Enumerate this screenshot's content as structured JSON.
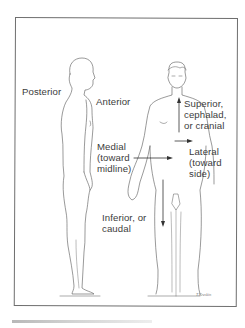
{
  "figure": {
    "type": "anatomical-directional-terms",
    "left_figure": "side view of human body",
    "right_figure": "front view of human body"
  },
  "labels": {
    "posterior": "Posterior",
    "anterior": "Anterior",
    "superior": [
      "Superior,",
      "cephalad,",
      "or cranial"
    ],
    "lateral": [
      "Lateral",
      "(toward",
      "side)"
    ],
    "medial": [
      "Medial",
      "(toward",
      "midline)"
    ],
    "inferior": [
      "Inferior, or",
      "caudal"
    ]
  },
  "signature": "T.Kreskin",
  "colors": {
    "line": "#4a4a4a",
    "frame": "#6e6e6e",
    "background": "#ffffff"
  }
}
